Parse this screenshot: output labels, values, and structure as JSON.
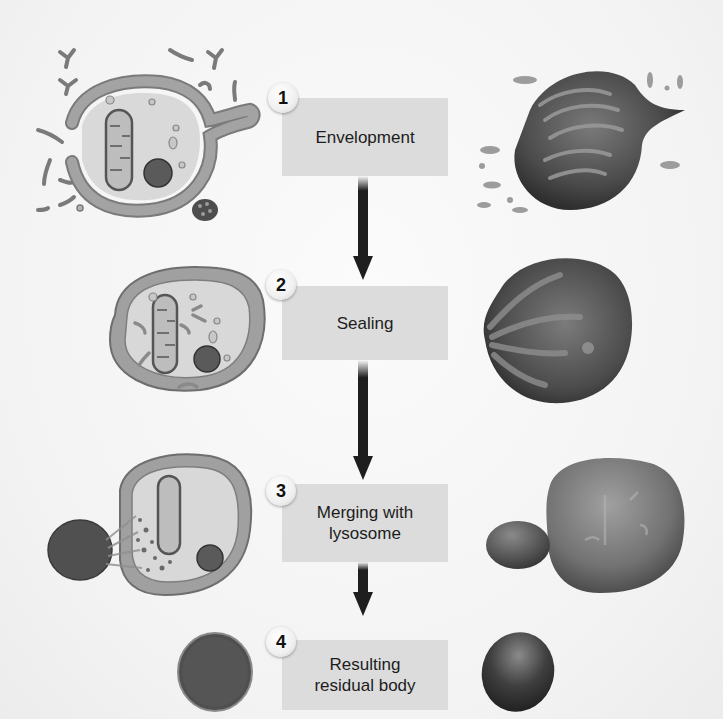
{
  "diagram": {
    "steps": [
      {
        "number": "1",
        "label": "Envelopment"
      },
      {
        "number": "2",
        "label": "Sealing"
      },
      {
        "number": "3",
        "label": "Merging with\nlysosome"
      },
      {
        "number": "4",
        "label": "Resulting\nresidual body"
      }
    ],
    "left_column": [
      {
        "name": "cell-envelopment-schematic"
      },
      {
        "name": "cell-sealed-schematic"
      },
      {
        "name": "cell-lysosome-merge-schematic"
      },
      {
        "name": "residual-body-schematic"
      }
    ],
    "right_column": [
      {
        "name": "cell-envelopment-3d"
      },
      {
        "name": "cell-sealed-3d"
      },
      {
        "name": "cell-lysosome-merge-3d"
      },
      {
        "name": "residual-body-3d"
      }
    ],
    "colors": {
      "box_fill": "#dcdcdc",
      "membrane": "#8a8a8a",
      "cytoplasm": "#d9d9d9",
      "organelle_dark": "#555555",
      "arrow": "#1e1e1e",
      "background": "#f6f6f6"
    }
  }
}
